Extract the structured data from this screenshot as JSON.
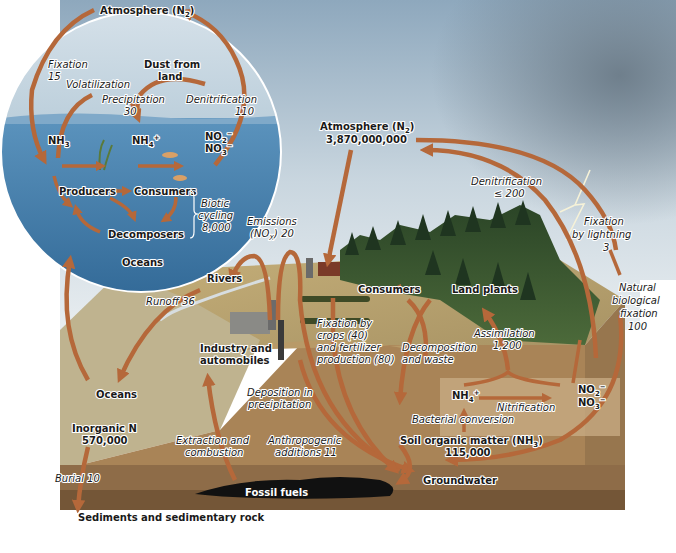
{
  "colors": {
    "sky_top": "#9fb7c9",
    "sky_bottom": "#dfe7ec",
    "ocean": "#4d86b2",
    "ocean_deep": "#356b97",
    "land": "#c9b27f",
    "land_side": "#b89a68",
    "soil_layer": "#a98457",
    "sediment_layer": "#8c6b48",
    "fossil_fuel": "#111111",
    "arrow": "#b5683a",
    "forest": "#2f4a2a",
    "text": "#1a1a1a"
  },
  "ocean_inset": {
    "atmosphere": "Atmosphere (N",
    "atmosphere_sub": "2",
    "atmosphere_close": ")",
    "fixation": "Fixation",
    "fixation_value": "15",
    "dust": "Dust from",
    "dust2": "land",
    "volatilization": "Volatilization",
    "precipitation": "Precipitation",
    "precipitation_value": "30",
    "denitrification": "Denitrification",
    "denitrification_value": "110",
    "nh3": "NH",
    "nh3_sub": "3",
    "nh4": "NH",
    "nh4_sub": "4",
    "nh4_sup": "+",
    "no2": "NO",
    "no2_sub": "2",
    "no2_sup": "−",
    "no3": "NO",
    "no3_sub": "3",
    "no3_sup": "−",
    "producers": "Producers",
    "consumers": "Consumers",
    "decomposers": "Decomposers",
    "biotic": "Biotic",
    "biotic2": "cycling",
    "biotic_value": "8,000",
    "oceans": "Oceans"
  },
  "land": {
    "atmosphere": "Atmosphere (N",
    "atmosphere_sub": "2",
    "atmosphere_close": ")",
    "atmosphere_value": "3,870,000,000",
    "denitrification": "Denitrification",
    "denitrification_value": "≤ 200",
    "fixation_lightning": "Fixation",
    "fixation_lightning2": "by lightning",
    "fixation_lightning_value": "3",
    "natural_fixation": "Natural",
    "natural_fixation2": "biological",
    "natural_fixation3": "fixation",
    "natural_fixation_value": "100",
    "emissions": "Emissions",
    "emissions2": "(NO",
    "emissions_sub": "X",
    "emissions3": ") 20",
    "rivers": "Rivers",
    "runoff": "Runoff 36",
    "consumers": "Consumers",
    "land_plants": "Land plants",
    "fixation_crops": "Fixation by",
    "fixation_crops2": "crops (40)",
    "fixation_crops3": "and fertilizer",
    "fixation_crops4": "production (80)",
    "decomposition": "Decomposition",
    "decomposition2": "and waste",
    "assimilation": "Assimilation",
    "assimilation_value": "1,200",
    "industry": "Industry and",
    "industry2": "automobiles",
    "oceans": "Oceans",
    "inorganic": "Inorganic N",
    "inorganic_value": "570,000",
    "deposition": "Deposition in",
    "deposition2": "precipitation",
    "extraction": "Extraction and",
    "extraction2": "combustion",
    "anthropogenic": "Anthropogenic",
    "anthropogenic2": "additions 11",
    "nh4": "NH",
    "nh4_sub": "4",
    "nh4_sup": "+",
    "nitrification": "Nitrification",
    "no2": "NO",
    "no2_sub": "2",
    "no2_sup": "−",
    "no3": "NO",
    "no3_sub": "3",
    "no3_sup": "−",
    "bacterial": "Bacterial conversion",
    "soil": "Soil organic matter (NH",
    "soil_sub": "3",
    "soil_close": ")",
    "soil_value": "115,000",
    "groundwater": "Groundwater",
    "burial": "Burial 10",
    "fossil_fuels": "Fossil fuels",
    "sediments": "Sediments and sedimentary rock"
  }
}
